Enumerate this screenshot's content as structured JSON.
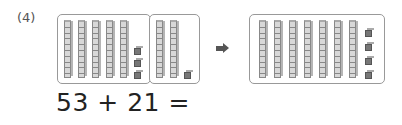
{
  "problem": {
    "label": "(4)",
    "equation": "53 + 21 =",
    "first_addend": {
      "tens": 5,
      "ones": 3
    },
    "second_addend": {
      "tens": 2,
      "ones": 1
    },
    "result_blocks": {
      "tens": 7,
      "ones": 4
    },
    "arrow_icon": "right-arrow-icon"
  }
}
